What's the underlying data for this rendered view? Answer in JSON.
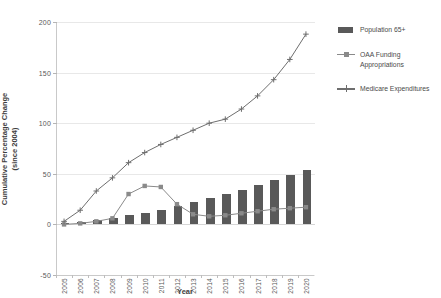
{
  "chart_data": {
    "type": "bar",
    "title": "",
    "xlabel": "Year",
    "ylabel": "Cumulative Percentage Change (since 2004)",
    "ylabel_line1": "Cumulative Percentage Change",
    "ylabel_line2": "(since 2004)",
    "ylim": [
      -50,
      200
    ],
    "yticks": [
      200,
      150,
      100,
      50,
      0,
      -50
    ],
    "ytick_labels": [
      "200",
      "150",
      "100",
      "50",
      "0",
      "-50"
    ],
    "grid": true,
    "legend_position": "right",
    "categories": [
      "2005",
      "2006",
      "2007",
      "2008",
      "2009",
      "2010",
      "2011",
      "2012",
      "2013",
      "2014",
      "2015",
      "2016",
      "2017",
      "2018",
      "2019",
      "2020"
    ],
    "series": [
      {
        "name": "Population 65+",
        "type": "bar",
        "color": "#595959",
        "values": [
          1,
          2,
          4,
          6,
          9,
          11,
          14,
          18,
          22,
          26,
          30,
          34,
          39,
          44,
          49,
          54
        ]
      },
      {
        "name": "OAA Funding Appropriations",
        "type": "line",
        "color": "#8a8a8a",
        "marker": "square",
        "values": [
          0,
          1,
          3,
          6,
          30,
          38,
          37,
          20,
          10,
          8,
          9,
          11,
          13,
          15,
          16,
          17
        ]
      },
      {
        "name": "Medicare Expenditures",
        "type": "line",
        "color": "#6e6e6e",
        "marker": "cross",
        "values": [
          3,
          14,
          33,
          46,
          61,
          71,
          79,
          86,
          93,
          100,
          104,
          114,
          127,
          143,
          163,
          188
        ]
      }
    ]
  },
  "legend": {
    "items": [
      {
        "label": "Population 65+",
        "key": "bar-swatch"
      },
      {
        "label": "OAA Funding Appropriations",
        "key": "square-marker-line"
      },
      {
        "label": "Medicare Expenditures",
        "key": "cross-marker-line"
      }
    ]
  }
}
